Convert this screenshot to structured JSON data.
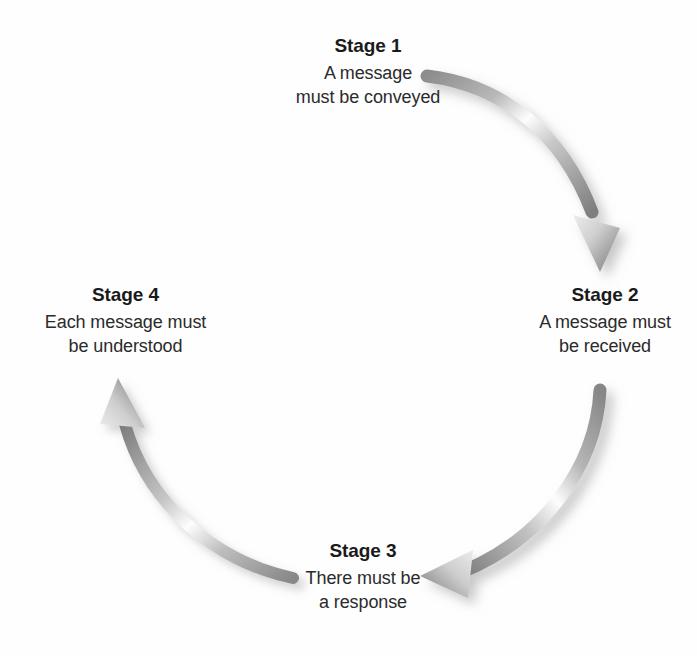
{
  "diagram": {
    "type": "cycle-diagram",
    "background_color": "#ffffff",
    "text_color": "#1a1a1a",
    "arrow_color": "#9a9a9a",
    "arrow_highlight_color": "#ffffff",
    "arrow_shadow_color": "#b8b8b8"
  },
  "stages": [
    {
      "title": "Stage 1",
      "lines": [
        "A message",
        "must be conveyed"
      ],
      "position": "top"
    },
    {
      "title": "Stage 2",
      "lines": [
        "A message must",
        "be received"
      ],
      "position": "right"
    },
    {
      "title": "Stage 3",
      "lines": [
        "There must be",
        "a response"
      ],
      "position": "bottom"
    },
    {
      "title": "Stage 4",
      "lines": [
        "Each message must",
        "be understood"
      ],
      "position": "left"
    }
  ],
  "arrows": [
    {
      "name": "arrow-stage1-to-stage2",
      "from": "Stage 1",
      "to": "Stage 2",
      "direction": "clockwise"
    },
    {
      "name": "arrow-stage2-to-stage3",
      "from": "Stage 2",
      "to": "Stage 3",
      "direction": "clockwise"
    },
    {
      "name": "arrow-stage3-to-stage4",
      "from": "Stage 3",
      "to": "Stage 4",
      "direction": "clockwise"
    }
  ]
}
